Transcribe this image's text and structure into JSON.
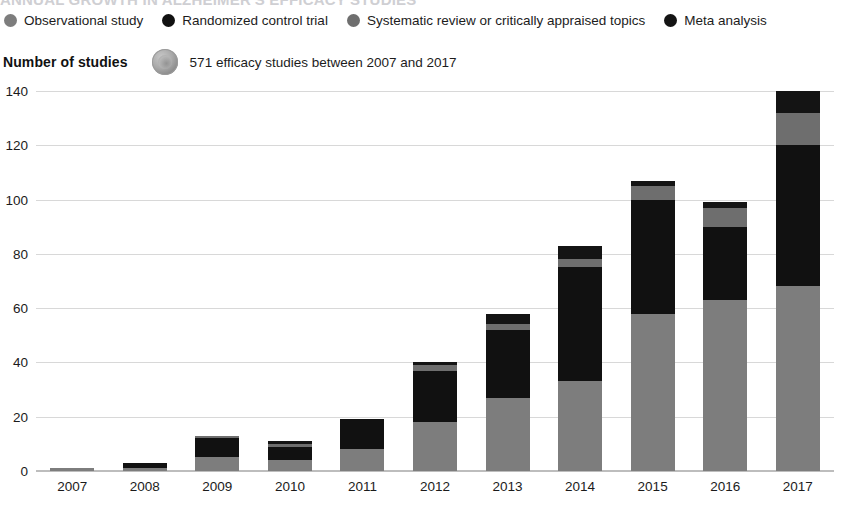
{
  "clipped_headline": "ANNUAL GROWTH IN ALZHEIMER'S EFFICACY STUDIES",
  "legend": {
    "items": [
      {
        "label": "Observational study",
        "color": "#7d7d7d"
      },
      {
        "label": "Randomized control trial",
        "color": "#111111"
      },
      {
        "label": "Systematic review or critically appraised topics",
        "color": "#6e6e6e"
      },
      {
        "label": "Meta analysis",
        "color": "#141414"
      }
    ]
  },
  "subtitle": {
    "axis_title": "Number of studies",
    "badge_icon": "study-badge-icon",
    "text": "571 efficacy studies between 2007 and 2017"
  },
  "chart_data": {
    "type": "bar",
    "stacked": true,
    "title": "Number of studies",
    "subtitle": "571 efficacy studies between 2007 and 2017",
    "xlabel": "",
    "ylabel": "Number of studies",
    "ylim": [
      0,
      140
    ],
    "yticks": [
      0,
      20,
      40,
      60,
      80,
      100,
      120,
      140
    ],
    "ytick_labels": [
      "0",
      "20",
      "40",
      "60",
      "80",
      "100",
      "120",
      "140"
    ],
    "grid": true,
    "legend_position": "top",
    "categories": [
      "2007",
      "2008",
      "2009",
      "2010",
      "2011",
      "2012",
      "2013",
      "2014",
      "2015",
      "2016",
      "2017"
    ],
    "series": [
      {
        "name": "Observational study",
        "color": "#7d7d7d",
        "values": [
          1,
          1,
          5,
          4,
          8,
          18,
          27,
          33,
          58,
          63,
          68
        ]
      },
      {
        "name": "Randomized control trial",
        "color": "#111111",
        "values": [
          0,
          2,
          7,
          5,
          11,
          19,
          25,
          42,
          42,
          27,
          52
        ]
      },
      {
        "name": "Systematic review or critically appraised topics",
        "color": "#6e6e6e",
        "values": [
          0,
          0,
          1,
          1,
          0,
          2,
          2,
          3,
          5,
          7,
          12
        ]
      },
      {
        "name": "Meta analysis",
        "color": "#141414",
        "values": [
          0,
          0,
          0,
          1,
          0,
          1,
          4,
          5,
          2,
          2,
          8
        ]
      }
    ],
    "totals": [
      1,
      3,
      13,
      11,
      19,
      40,
      58,
      83,
      107,
      99,
      140
    ]
  }
}
